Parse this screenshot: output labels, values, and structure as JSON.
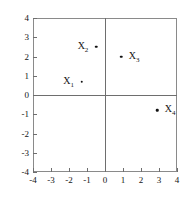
{
  "chart_data": {
    "type": "scatter",
    "title": "",
    "xlabel": "",
    "ylabel": "",
    "xlim": [
      -4,
      4
    ],
    "ylim": [
      -4,
      4
    ],
    "grid": false,
    "legend": "none",
    "axes_through_origin": true,
    "xticks": [
      -4,
      -3,
      -2,
      -1,
      0,
      1,
      2,
      3,
      4
    ],
    "yticks": [
      -4,
      -3,
      -2,
      -1,
      0,
      1,
      2,
      3,
      4
    ],
    "xtick_labels": [
      "-4",
      "-3",
      "-2",
      "-1",
      "0",
      "1",
      "2",
      "3",
      "4"
    ],
    "ytick_labels": [
      "-4",
      "-3",
      "-2",
      "-1",
      "0",
      "1",
      "2",
      "3",
      "4"
    ],
    "points": [
      {
        "label": "X",
        "sub": "1",
        "x": -1.3,
        "y": 0.7,
        "label_side": "left"
      },
      {
        "label": "X",
        "sub": "2",
        "x": -0.5,
        "y": 2.5,
        "label_side": "left"
      },
      {
        "label": "X",
        "sub": "3",
        "x": 0.9,
        "y": 2.0,
        "label_side": "right"
      },
      {
        "label": "X",
        "sub": "4",
        "x": 2.9,
        "y": -0.8,
        "label_side": "right"
      }
    ]
  },
  "axis": {
    "x_labels": [
      "-4",
      "-3",
      "-2",
      "-1",
      "0",
      "1",
      "2",
      "3",
      "4"
    ],
    "y_labels": [
      "4",
      "3",
      "2",
      "1",
      "0",
      "-1",
      "-2",
      "-3",
      "-4"
    ]
  },
  "points_text": {
    "p0_label": "X",
    "p0_sub": "1",
    "p1_label": "X",
    "p1_sub": "2",
    "p2_label": "X",
    "p2_sub": "3",
    "p3_label": "X",
    "p3_sub": "4"
  }
}
